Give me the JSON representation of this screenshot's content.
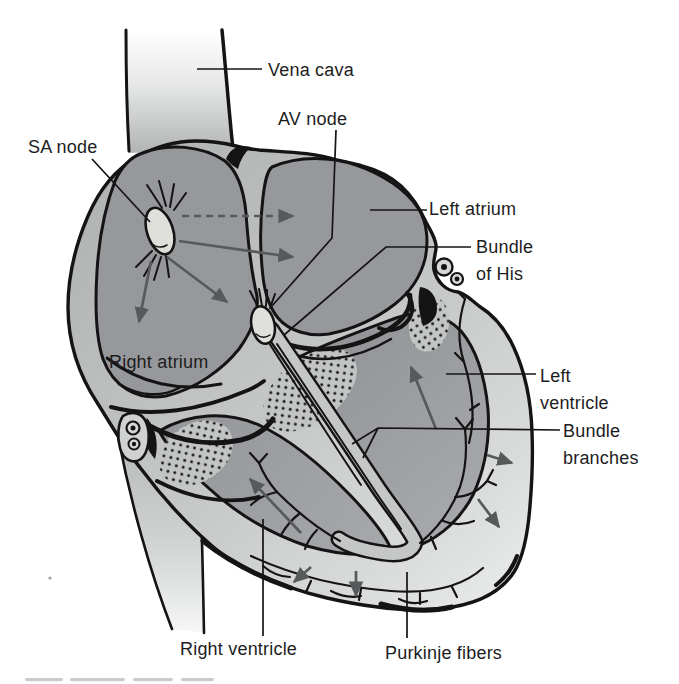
{
  "figure": {
    "labels": {
      "vena_cava": "Vena cava",
      "av_node": "AV node",
      "sa_node": "SA node",
      "left_atrium": "Left atrium",
      "bundle_of_his": [
        "Bundle",
        "of His"
      ],
      "right_atrium": "Right atrium",
      "left_ventricle": [
        "Left",
        "ventricle"
      ],
      "bundle_branches": [
        "Bundle",
        "branches"
      ],
      "right_ventricle": "Right ventricle",
      "purkinje_fibers": "Purkinje fibers"
    },
    "colors": {
      "background": "#ffffff",
      "ink": "#141414",
      "text": "#1d1d1e",
      "arrow": "#58595b",
      "chamber": "#97989b",
      "rim": "#c3c6c5",
      "node": "#dfe0dc",
      "stipple_bg": "#c2c5c4"
    }
  }
}
